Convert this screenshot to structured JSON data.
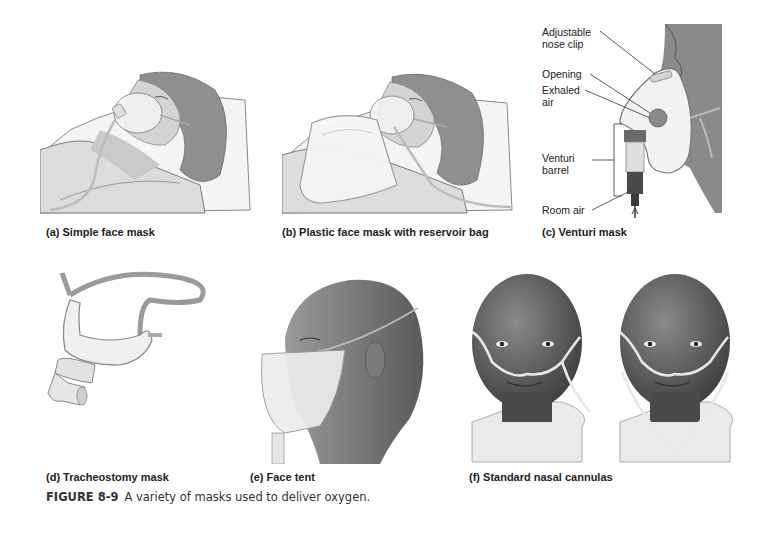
{
  "figure": {
    "number": "FIGURE 8-9",
    "caption": "A variety of masks used to deliver oxygen."
  },
  "panels": [
    {
      "id": "a",
      "caption": "(a) Simple face mask"
    },
    {
      "id": "b",
      "caption": "(b) Plastic face mask with reservoir bag"
    },
    {
      "id": "c",
      "caption": "(c) Venturi mask",
      "labels": [
        "Adjustable nose clip",
        "Opening",
        "Exhaled air",
        "Venturi barrel",
        "Room air"
      ]
    },
    {
      "id": "d",
      "caption": "(d) Tracheostomy mask"
    },
    {
      "id": "e",
      "caption": "(e) Face tent"
    },
    {
      "id": "f",
      "caption": "(f) Standard nasal cannulas"
    }
  ],
  "venturi_labels": {
    "nose_clip_1": "Adjustable",
    "nose_clip_2": "nose clip",
    "opening": "Opening",
    "exhaled_1": "Exhaled",
    "exhaled_2": "air",
    "barrel_1": "Venturi",
    "barrel_2": "barrel",
    "room_air": "Room air"
  },
  "colors": {
    "skin_light": "#d9d9d9",
    "skin_dark": "#5a5a5a",
    "outline": "#6b6b6b",
    "mask": "#f2f2f2",
    "tubing": "#e8e8e8"
  }
}
